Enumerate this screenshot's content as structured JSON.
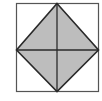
{
  "diagram": {
    "colors": {
      "background": "#ffffff",
      "outer_square_stroke": "#555555",
      "diamond_fill": "#bdbdbd",
      "diamond_stroke": "#2a2a2a",
      "diagonal_stroke": "#2a2a2a"
    },
    "outer_square": {
      "x": 16,
      "y": 3,
      "width": 83,
      "height": 89
    },
    "diamond_vertices": {
      "top": [
        57,
        3
      ],
      "right": [
        99,
        50
      ],
      "bottom": [
        57,
        92
      ],
      "left": [
        16,
        50
      ]
    }
  }
}
